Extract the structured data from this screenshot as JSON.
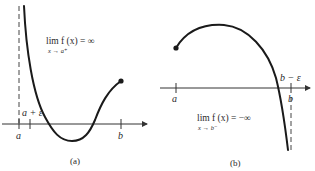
{
  "figure": {
    "panels": [
      {
        "id": "a",
        "caption": "(a)",
        "axis_labels": {
          "a": "a",
          "a_plus_eps": "a + ε",
          "b": "b"
        },
        "limit": {
          "main": "lim f (x) = ∞",
          "sub": "x → a⁺"
        },
        "description": "Function on (a, b] with vertical asymptote at x = a; f(x) → ∞ as x → a⁺; filled endpoint at b"
      },
      {
        "id": "b",
        "caption": "(b)",
        "axis_labels": {
          "a": "a",
          "b_minus_eps": "b − ε",
          "b": "b"
        },
        "limit": {
          "main": "lim f (x) = −∞",
          "sub": "x → b⁻"
        },
        "description": "Function on [a, b) with filled endpoint at a and vertical asymptote at x = b; f(x) → −∞ as x → b⁻"
      }
    ],
    "colors": {
      "curve": "#1a1a1a",
      "axis": "#333333",
      "text": "#2a2a2a",
      "background": "#ffffff"
    }
  }
}
